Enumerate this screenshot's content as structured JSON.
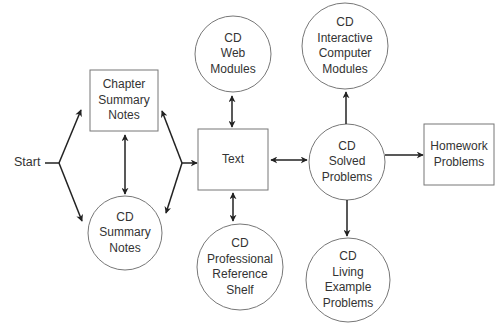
{
  "diagram": {
    "start_label": "Start",
    "nodes": {
      "chapter_summary": {
        "shape": "rect",
        "lines": [
          "Chapter",
          "Summary",
          "Notes"
        ]
      },
      "cd_summary": {
        "shape": "circle",
        "lines": [
          "CD",
          "Summary",
          "Notes"
        ]
      },
      "text": {
        "shape": "rect",
        "lines": [
          "Text"
        ]
      },
      "cd_web": {
        "shape": "circle",
        "lines": [
          "CD",
          "Web",
          "Modules"
        ]
      },
      "cd_professional": {
        "shape": "circle",
        "lines": [
          "CD",
          "Professional",
          "Reference",
          "Shelf"
        ]
      },
      "cd_interactive": {
        "shape": "circle",
        "lines": [
          "CD",
          "Interactive",
          "Computer",
          "Modules"
        ]
      },
      "cd_solved": {
        "shape": "circle",
        "lines": [
          "CD",
          "Solved",
          "Problems"
        ]
      },
      "homework": {
        "shape": "rect",
        "lines": [
          "Homework",
          "Problems"
        ]
      },
      "cd_living": {
        "shape": "circle",
        "lines": [
          "CD",
          "Living",
          "Example",
          "Problems"
        ]
      }
    },
    "edges": [
      {
        "from": "start",
        "to": "chapter_summary",
        "type": "directed"
      },
      {
        "from": "start",
        "to": "cd_summary",
        "type": "directed"
      },
      {
        "from": "chapter_summary",
        "to": "cd_summary",
        "type": "bidirectional"
      },
      {
        "from": "chapter_summary",
        "to": "text",
        "type": "bidirectional-fork"
      },
      {
        "from": "cd_summary",
        "to": "text",
        "type": "bidirectional-fork"
      },
      {
        "from": "text",
        "to": "cd_web",
        "type": "bidirectional"
      },
      {
        "from": "text",
        "to": "cd_professional",
        "type": "bidirectional"
      },
      {
        "from": "text",
        "to": "cd_solved",
        "type": "bidirectional"
      },
      {
        "from": "cd_solved",
        "to": "cd_interactive",
        "type": "directed"
      },
      {
        "from": "cd_solved",
        "to": "homework",
        "type": "directed"
      },
      {
        "from": "cd_solved",
        "to": "cd_living",
        "type": "directed"
      }
    ],
    "colors": {
      "stroke": "#222222",
      "node_stroke": "#777777",
      "text": "#333333",
      "background": "#ffffff"
    }
  }
}
